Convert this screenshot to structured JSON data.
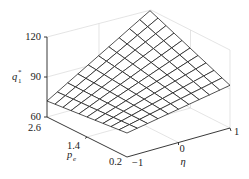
{
  "chart_data": {
    "type": "surface3d",
    "title": "",
    "xlabel": "η",
    "ylabel": "p_e",
    "zlabel": "q_1^*",
    "x_ticks": [
      "-1",
      "0",
      "1"
    ],
    "y_ticks": [
      "0.2",
      "1.4",
      "2.6"
    ],
    "z_ticks": [
      "60",
      "90",
      "120"
    ],
    "xlim": [
      -1,
      1
    ],
    "ylim": [
      0.2,
      2.6
    ],
    "zlim": [
      60,
      120
    ],
    "grid": true,
    "mesh_resolution": [
      10,
      10
    ],
    "corner_values": [
      {
        "eta": -1,
        "p_e": 2.6,
        "q1": 72
      },
      {
        "eta": 1,
        "p_e": 2.6,
        "q1": 118
      },
      {
        "eta": 1,
        "p_e": 0.2,
        "q1": 92
      },
      {
        "eta": -1,
        "p_e": 0.2,
        "q1": 78
      }
    ]
  },
  "labels": {
    "z_axis": "q",
    "z_sub": "1",
    "z_sup": "*",
    "y_axis": "p",
    "y_sub": "e",
    "x_axis": "η",
    "z_tick_120": "120",
    "z_tick_90": "90",
    "z_tick_60": "60",
    "y_tick_26": "2.6",
    "y_tick_14": "1.4",
    "y_tick_02": "0.2",
    "x_tick_m1": "−1",
    "x_tick_0": "0",
    "x_tick_1": "1"
  }
}
